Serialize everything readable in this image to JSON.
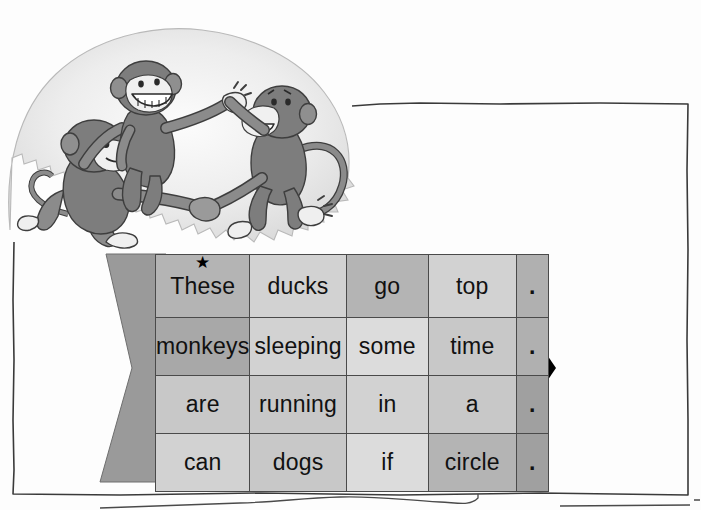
{
  "page": {
    "kind": "worksheet-page",
    "background_color": "#ffffff",
    "border_color": "#3a3a3a"
  },
  "illustration": {
    "name": "three-monkeys-dancing-in-a-circle",
    "description": "Three cartoon monkeys holding hands dancing in a circle",
    "cloud_fill": "#e8e8e8",
    "monkey_fill": "#8f8f8f",
    "monkey_shade": "#6f6f6f",
    "face_fill": "#f2f2f2"
  },
  "arrow": {
    "name": "right-pointing-arrow-band",
    "tail_color": "#9a9a9a",
    "head_color": "#000000",
    "direction": "right"
  },
  "star_marker": {
    "glyph": "★",
    "label": "example-star",
    "attached_to_cell": "These"
  },
  "word_table": {
    "rows": [
      {
        "cells": [
          {
            "text": "These",
            "tint": "g2",
            "star": true
          },
          {
            "text": "ducks",
            "tint": "g5",
            "star": false
          },
          {
            "text": "go",
            "tint": "g2",
            "star": false
          },
          {
            "text": "top",
            "tint": "g5",
            "star": false
          },
          {
            "text": ".",
            "tint": "dot",
            "star": false
          }
        ]
      },
      {
        "cells": [
          {
            "text": "monkeys",
            "tint": "g1",
            "star": false
          },
          {
            "text": "sleeping",
            "tint": "g5",
            "star": false
          },
          {
            "text": "some",
            "tint": "g6",
            "star": false
          },
          {
            "text": "time",
            "tint": "g4",
            "star": false
          },
          {
            "text": ".",
            "tint": "dot",
            "star": false
          }
        ]
      },
      {
        "cells": [
          {
            "text": "are",
            "tint": "g4",
            "star": false
          },
          {
            "text": "running",
            "tint": "g4",
            "star": false
          },
          {
            "text": "in",
            "tint": "g5",
            "star": false
          },
          {
            "text": "a",
            "tint": "g4",
            "star": false
          },
          {
            "text": ".",
            "tint": "dot-dark",
            "star": false
          }
        ]
      },
      {
        "cells": [
          {
            "text": "can",
            "tint": "g5",
            "star": false
          },
          {
            "text": "dogs",
            "tint": "g4",
            "star": false
          },
          {
            "text": "if",
            "tint": "g6",
            "star": false
          },
          {
            "text": "circle",
            "tint": "g2",
            "star": false
          },
          {
            "text": ".",
            "tint": "dot-dark",
            "star": false
          }
        ]
      }
    ]
  }
}
